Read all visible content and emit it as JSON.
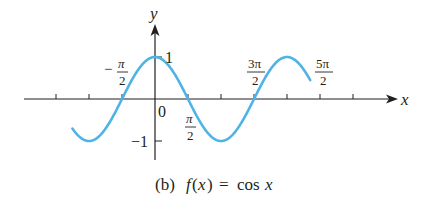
{
  "chart_data": {
    "type": "line",
    "caption": {
      "prefix": "(b)",
      "fname": "f",
      "open": "(",
      "var": "x",
      "close": ")",
      "eq": "=",
      "cos": "cos",
      "arg": "x"
    },
    "xlabel": "x",
    "ylabel": "y",
    "function": "cos(x)",
    "xlim": [
      -3.93,
      7.39
    ],
    "ylim": [
      -1,
      1
    ],
    "xtick_labels": [
      {
        "value": -1.5708,
        "num": "π",
        "den": "2",
        "sign": "−"
      },
      {
        "value": 1.5708,
        "num": "π",
        "den": "2",
        "sign": ""
      },
      {
        "value": 4.7124,
        "num": "3π",
        "den": "2",
        "sign": ""
      },
      {
        "value": 7.854,
        "num": "5π",
        "den": "2",
        "sign": ""
      }
    ],
    "ytick_labels": [
      {
        "value": 1,
        "label": "1"
      },
      {
        "value": -1,
        "label": "−1"
      }
    ],
    "origin_label": "0",
    "tick_spacing": "π/2",
    "x": [
      -3.93,
      -3.14,
      -2.36,
      -1.57,
      -0.79,
      0,
      0.79,
      1.57,
      2.36,
      3.14,
      3.93,
      4.71,
      5.5,
      6.28,
      7.07,
      7.85,
      8.64,
      9.42,
      10.21,
      10.99
    ],
    "y": [
      -0.71,
      -1,
      -0.71,
      0,
      0.71,
      1,
      0.71,
      0,
      -0.71,
      -1,
      -0.71,
      0,
      0.71,
      1,
      0.71,
      0,
      -0.71,
      -1,
      -0.71,
      0
    ],
    "curve_color": "#4fb3e6",
    "axis_color": "#231f20",
    "grid": false
  }
}
